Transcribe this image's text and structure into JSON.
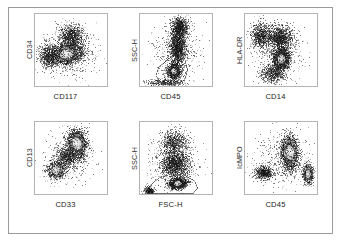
{
  "figure": {
    "type": "flow-cytometry-dot-plot-array",
    "rows": 2,
    "columns": 3,
    "frame_color": "#9a9a9a",
    "plot_border_color": "#b4b4b4",
    "background_color": "#ffffff",
    "dot_color": "#1a1a1a",
    "core_color": "#ffffff"
  },
  "panels": [
    {
      "id": "panel-cd34-cd117",
      "ylabel": "CD34",
      "xlabel": "CD117",
      "has_gate": false,
      "populations": [
        {
          "name": "blast-cluster",
          "cx": 0.44,
          "cy": 0.55,
          "rx": 0.22,
          "ry": 0.13,
          "angle": -12,
          "n": 2600,
          "core": 0.4
        },
        {
          "name": "upper-spread",
          "cx": 0.5,
          "cy": 0.3,
          "rx": 0.17,
          "ry": 0.15,
          "angle": 0,
          "n": 900,
          "core": 0.0
        },
        {
          "name": "left-tail",
          "cx": 0.18,
          "cy": 0.58,
          "rx": 0.13,
          "ry": 0.17,
          "angle": 0,
          "n": 700,
          "core": 0.0
        },
        {
          "name": "background-noise",
          "cx": 0.47,
          "cy": 0.52,
          "rx": 0.4,
          "ry": 0.34,
          "angle": 0,
          "n": 650,
          "core": 0.0
        }
      ]
    },
    {
      "id": "panel-ssch-cd45",
      "ylabel": "SSC-H",
      "xlabel": "CD45",
      "has_gate": true,
      "gate": [
        [
          0.3,
          0.96
        ],
        [
          0.22,
          0.86
        ],
        [
          0.26,
          0.74
        ],
        [
          0.4,
          0.62
        ],
        [
          0.52,
          0.55
        ],
        [
          0.62,
          0.62
        ],
        [
          0.66,
          0.78
        ],
        [
          0.62,
          0.92
        ],
        [
          0.46,
          0.99
        ]
      ],
      "populations": [
        {
          "name": "blast-core",
          "cx": 0.47,
          "cy": 0.79,
          "rx": 0.09,
          "ry": 0.1,
          "angle": 0,
          "n": 1500,
          "core": 0.42
        },
        {
          "name": "granulocyte-stream",
          "cx": 0.52,
          "cy": 0.44,
          "rx": 0.11,
          "ry": 0.28,
          "angle": 0,
          "n": 1700,
          "core": 0.0
        },
        {
          "name": "upper-scatter",
          "cx": 0.55,
          "cy": 0.18,
          "rx": 0.12,
          "ry": 0.14,
          "angle": 0,
          "n": 800,
          "core": 0.0
        },
        {
          "name": "debris-floor",
          "cx": 0.35,
          "cy": 0.95,
          "rx": 0.26,
          "ry": 0.05,
          "angle": 0,
          "n": 400,
          "core": 0.0
        },
        {
          "name": "background-noise",
          "cx": 0.5,
          "cy": 0.55,
          "rx": 0.34,
          "ry": 0.38,
          "angle": 0,
          "n": 420,
          "core": 0.0
        }
      ]
    },
    {
      "id": "panel-hladr-cd14",
      "ylabel": "HLA-DR",
      "xlabel": "CD14",
      "has_gate": false,
      "populations": [
        {
          "name": "main-cluster",
          "cx": 0.5,
          "cy": 0.62,
          "rx": 0.11,
          "ry": 0.14,
          "angle": 0,
          "n": 2100,
          "core": 0.4
        },
        {
          "name": "upper-wedge",
          "cx": 0.48,
          "cy": 0.33,
          "rx": 0.17,
          "ry": 0.17,
          "angle": 0,
          "n": 1200,
          "core": 0.0
        },
        {
          "name": "left-cloud",
          "cx": 0.22,
          "cy": 0.3,
          "rx": 0.15,
          "ry": 0.18,
          "angle": 0,
          "n": 900,
          "core": 0.0
        },
        {
          "name": "lower-tail",
          "cx": 0.38,
          "cy": 0.83,
          "rx": 0.16,
          "ry": 0.12,
          "angle": 0,
          "n": 650,
          "core": 0.0
        },
        {
          "name": "background-noise",
          "cx": 0.48,
          "cy": 0.52,
          "rx": 0.36,
          "ry": 0.38,
          "angle": 0,
          "n": 500,
          "core": 0.0
        }
      ]
    },
    {
      "id": "panel-cd13-cd33",
      "ylabel": "CD13",
      "xlabel": "CD33",
      "has_gate": false,
      "populations": [
        {
          "name": "upper-right-cluster",
          "cx": 0.58,
          "cy": 0.3,
          "rx": 0.13,
          "ry": 0.19,
          "angle": -8,
          "n": 2300,
          "core": 0.42
        },
        {
          "name": "lower-left-cluster",
          "cx": 0.29,
          "cy": 0.66,
          "rx": 0.12,
          "ry": 0.12,
          "angle": 0,
          "n": 1100,
          "core": 0.22
        },
        {
          "name": "connecting-bridge",
          "cx": 0.44,
          "cy": 0.48,
          "rx": 0.12,
          "ry": 0.15,
          "angle": -30,
          "n": 600,
          "core": 0.0
        },
        {
          "name": "background-noise",
          "cx": 0.45,
          "cy": 0.5,
          "rx": 0.33,
          "ry": 0.36,
          "angle": 0,
          "n": 450,
          "core": 0.0
        }
      ]
    },
    {
      "id": "panel-ssch-fsch",
      "ylabel": "SSC-H",
      "xlabel": "FSC-H",
      "has_gate": true,
      "gate": [
        [
          0.1,
          0.99
        ],
        [
          0.14,
          0.88
        ],
        [
          0.26,
          0.78
        ],
        [
          0.44,
          0.72
        ],
        [
          0.62,
          0.74
        ],
        [
          0.76,
          0.82
        ],
        [
          0.8,
          0.92
        ],
        [
          0.74,
          0.99
        ]
      ],
      "populations": [
        {
          "name": "blast-gate-core",
          "cx": 0.52,
          "cy": 0.85,
          "rx": 0.12,
          "ry": 0.07,
          "angle": -8,
          "n": 1600,
          "core": 0.4
        },
        {
          "name": "mid-scatter",
          "cx": 0.48,
          "cy": 0.58,
          "rx": 0.2,
          "ry": 0.2,
          "angle": 0,
          "n": 1500,
          "core": 0.0
        },
        {
          "name": "upper-haze",
          "cx": 0.47,
          "cy": 0.28,
          "rx": 0.19,
          "ry": 0.17,
          "angle": 0,
          "n": 800,
          "core": 0.0
        },
        {
          "name": "debris-corner",
          "cx": 0.12,
          "cy": 0.95,
          "rx": 0.07,
          "ry": 0.06,
          "angle": 0,
          "n": 350,
          "core": 0.0
        },
        {
          "name": "background-noise",
          "cx": 0.48,
          "cy": 0.58,
          "rx": 0.34,
          "ry": 0.36,
          "angle": 0,
          "n": 450,
          "core": 0.0
        }
      ]
    },
    {
      "id": "panel-icmpo-cd45",
      "ylabel": "IcMPO",
      "xlabel": "CD45",
      "has_gate": false,
      "populations": [
        {
          "name": "mpo-positive-cluster",
          "cx": 0.62,
          "cy": 0.42,
          "rx": 0.11,
          "ry": 0.23,
          "angle": -5,
          "n": 2400,
          "core": 0.4
        },
        {
          "name": "right-lower-cluster",
          "cx": 0.87,
          "cy": 0.72,
          "rx": 0.07,
          "ry": 0.13,
          "angle": 0,
          "n": 900,
          "core": 0.18
        },
        {
          "name": "negative-cloud",
          "cx": 0.26,
          "cy": 0.7,
          "rx": 0.13,
          "ry": 0.09,
          "angle": 0,
          "n": 700,
          "core": 0.0
        },
        {
          "name": "background-noise",
          "cx": 0.52,
          "cy": 0.52,
          "rx": 0.36,
          "ry": 0.36,
          "angle": 0,
          "n": 500,
          "core": 0.0
        }
      ]
    }
  ]
}
